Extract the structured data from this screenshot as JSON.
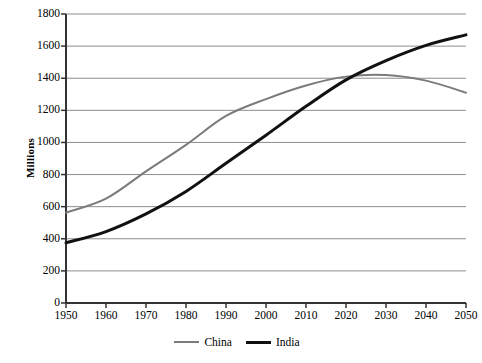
{
  "chart_data": {
    "type": "line",
    "title": "",
    "xlabel": "",
    "ylabel": "Millions",
    "xlim": [
      1950,
      2050
    ],
    "ylim": [
      0,
      1800
    ],
    "grid": true,
    "legend_position": "bottom-center",
    "x": [
      1950,
      1960,
      1970,
      1980,
      1990,
      2000,
      2010,
      2020,
      2030,
      2040,
      2050
    ],
    "xticks": [
      "1950",
      "1960",
      "1970",
      "1980",
      "1990",
      "2000",
      "2010",
      "2020",
      "2030",
      "2040",
      "2050"
    ],
    "yticks": [
      "0",
      "200",
      "400",
      "600",
      "800",
      "1000",
      "1200",
      "1400",
      "1600",
      "1800"
    ],
    "ytick_values": [
      0,
      200,
      400,
      600,
      800,
      1000,
      1200,
      1400,
      1600,
      1800
    ],
    "series": [
      {
        "name": "China",
        "color": "#7b7b7b",
        "width": 2,
        "values": [
          563,
          650,
          820,
          985,
          1165,
          1270,
          1355,
          1410,
          1420,
          1385,
          1310
        ]
      },
      {
        "name": "India",
        "color": "#111111",
        "width": 3,
        "values": [
          375,
          445,
          555,
          695,
          870,
          1045,
          1225,
          1390,
          1510,
          1605,
          1670
        ]
      }
    ],
    "annotations": [
      "China and India curves cross at approximately 2027 near 1400 million"
    ]
  },
  "legend": {
    "items": [
      {
        "label": "China"
      },
      {
        "label": "India"
      }
    ]
  }
}
